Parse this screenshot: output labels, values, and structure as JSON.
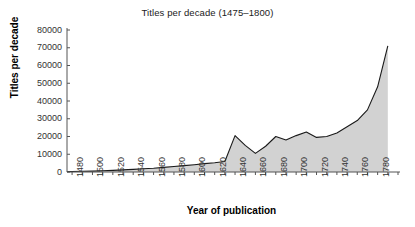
{
  "chart_data": {
    "type": "area",
    "title": "Titles per decade (1475–1800)",
    "xlabel": "Year of publication",
    "ylabel": "Titles per decade",
    "grid": false,
    "legend": "none",
    "xlim": [
      1475,
      1800
    ],
    "ylim": [
      0,
      80000
    ],
    "ytick_labels": [
      "80000",
      "70000",
      "60000",
      "50000",
      "40000",
      "30000",
      "20000",
      "10000",
      "0"
    ],
    "ytick_values": [
      80000,
      70000,
      60000,
      50000,
      40000,
      30000,
      20000,
      10000,
      0
    ],
    "xtick_labels": [
      "1480",
      "1500",
      "1520",
      "1540",
      "1560",
      "1580",
      "1600",
      "1620",
      "1640",
      "1660",
      "1680",
      "1700",
      "1720",
      "1740",
      "1760",
      "1780"
    ],
    "xtick_values": [
      1480,
      1500,
      1520,
      1540,
      1560,
      1580,
      1600,
      1620,
      1640,
      1660,
      1680,
      1700,
      1720,
      1740,
      1760,
      1780
    ],
    "minor_tick_step": 10,
    "x": [
      1475,
      1480,
      1490,
      1500,
      1510,
      1520,
      1530,
      1540,
      1550,
      1560,
      1570,
      1580,
      1590,
      1600,
      1610,
      1620,
      1630,
      1640,
      1650,
      1660,
      1670,
      1680,
      1690,
      1700,
      1710,
      1720,
      1730,
      1740,
      1750,
      1760,
      1770,
      1780,
      1790
    ],
    "values": [
      200,
      300,
      400,
      500,
      700,
      900,
      1200,
      1500,
      1800,
      2100,
      2600,
      3100,
      3600,
      4100,
      4700,
      5200,
      5900,
      20500,
      15000,
      10500,
      14500,
      20000,
      18000,
      20500,
      22500,
      19500,
      20000,
      22000,
      25500,
      29000,
      35000,
      48000,
      71000
    ],
    "series_name": "Titles per decade",
    "area_fill_color": "#d2d2d2",
    "line_color": "#1a1a1a",
    "axis_color": "#555555"
  }
}
